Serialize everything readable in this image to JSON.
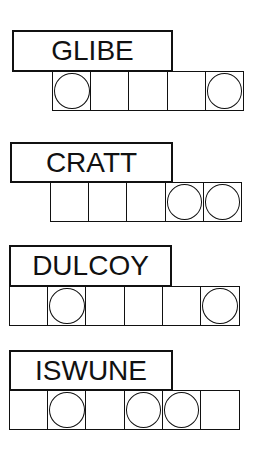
{
  "puzzles": [
    {
      "scrambled": "GLIBE",
      "cells": 5,
      "circled": [
        1,
        5
      ]
    },
    {
      "scrambled": "CRATT",
      "cells": 5,
      "circled": [
        4,
        5
      ]
    },
    {
      "scrambled": "DULCOY",
      "cells": 6,
      "circled": [
        2,
        6
      ]
    },
    {
      "scrambled": "ISWUNE",
      "cells": 6,
      "circled": [
        2,
        4,
        5
      ]
    }
  ],
  "colors": {
    "ink": "#111111",
    "background": "#ffffff"
  }
}
